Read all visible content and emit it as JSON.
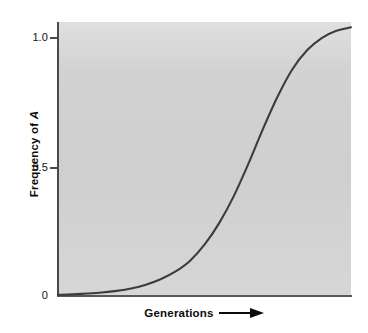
{
  "figure": {
    "background_color": "#ffffff",
    "panel_color": "#d2d2d2",
    "axis_color": "#4a4a4a",
    "curve_color": "#3c3c3c"
  },
  "axes": {
    "y_title_prefix": "Frequency of ",
    "y_title_symbol": "A",
    "x_title": "Generations",
    "x_arrow_icon": "right-arrow-icon",
    "y_tick_labels": [
      "1.0",
      "0.5",
      "0"
    ]
  },
  "chart_data": {
    "type": "line",
    "title": "",
    "xlabel": "Generations",
    "ylabel": "Frequency of A",
    "xlim": [
      0,
      100
    ],
    "ylim": [
      0,
      1.0
    ],
    "yticks": [
      0,
      0.5,
      1.0
    ],
    "ytick_labels": [
      "0",
      "0.5",
      "1.0"
    ],
    "xticks": [],
    "xtick_labels": [],
    "grid": false,
    "legend": false,
    "series": [
      {
        "name": "Frequency of A",
        "description": "Logistic (sigmoidal) increase of allele A frequency over generations",
        "x": [
          0,
          5,
          10,
          15,
          20,
          25,
          30,
          35,
          40,
          45,
          50,
          55,
          60,
          65,
          70,
          75,
          80,
          85,
          90,
          95,
          100
        ],
        "y": [
          0.004,
          0.006,
          0.009,
          0.013,
          0.019,
          0.028,
          0.042,
          0.062,
          0.09,
          0.13,
          0.19,
          0.27,
          0.37,
          0.49,
          0.62,
          0.74,
          0.84,
          0.91,
          0.955,
          0.982,
          0.995
        ]
      }
    ],
    "annotations": [
      {
        "text": "curve begins near 0 and saturates at 1.0"
      },
      {
        "text": "midpoint (0.5) reached at approximately 66% of the x-range"
      }
    ]
  }
}
